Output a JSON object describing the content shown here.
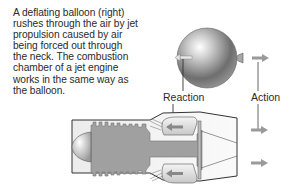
{
  "caption": {
    "lines": [
      "A deflating balloon (right)",
      "rushes through the air by jet",
      "propulsion caused by air",
      "being forced out through",
      "the neck. The combustion",
      "chamber of a jet engine",
      "works in the same way as",
      "the balloon."
    ]
  },
  "labels": {
    "reaction": "Reaction",
    "action": "Action"
  },
  "colors": {
    "text": "#2a2a2a",
    "engine_core": "#9a9a9a",
    "engine_shell": "#e6e6e6",
    "outline": "#3a3a3a",
    "arrow": "#8c8c8c"
  }
}
